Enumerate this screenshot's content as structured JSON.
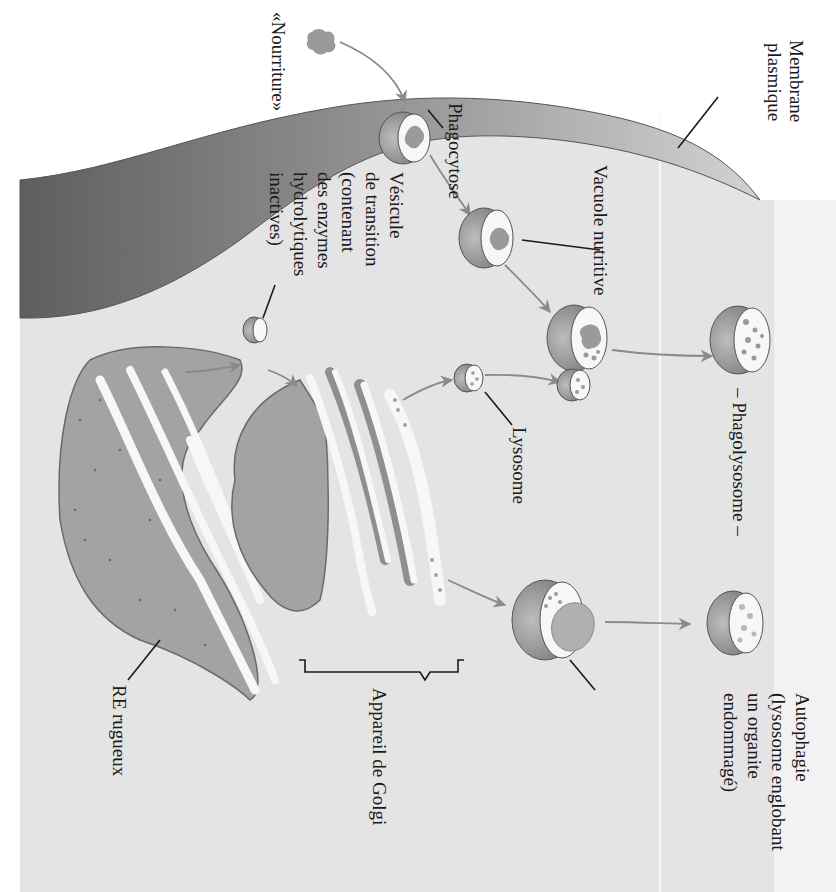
{
  "figure": {
    "orientation": "rotated 90deg clockwise",
    "language": "fr",
    "colors": {
      "cytoplasm": "#e4e4e4",
      "membrane_dark": "#6e6e6e",
      "membrane_light": "#cfcfcf",
      "organelle_fill": "#a3a3a3",
      "lumen": "#f7f7f7",
      "arrow": "#8a8a8a",
      "text": "#1a1a1a"
    }
  },
  "labels": {
    "membrane": [
      "Membrane",
      "plasmique"
    ],
    "food": "«Nourriture»",
    "phagocytosis": "Phagocytose",
    "food_vacuole": "Vacuole nutritive",
    "transport_vesicle": [
      "Vésicule",
      "de transition",
      "(contenant",
      "des enzymes",
      "hydrolytiques",
      "inactives)"
    ],
    "phagolysosome": "– Phagolysosome –",
    "lysosome": "Lysosome",
    "autophagy": [
      "Autophagie",
      "(lysosome englobant",
      "un organite",
      "endommagé)"
    ],
    "golgi": "Appareil de Golgi",
    "rough_er": "RE rugueux"
  }
}
